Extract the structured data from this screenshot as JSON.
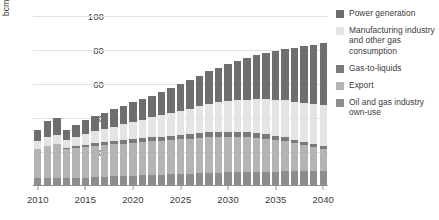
{
  "chart_data": {
    "type": "bar",
    "stacked": true,
    "title": "",
    "subtitle": "",
    "xlabel": "",
    "ylabel": "bcm",
    "ylim": [
      0,
      100
    ],
    "yticks": [
      20,
      40,
      60,
      80,
      100
    ],
    "xticks": [
      2010,
      2015,
      2020,
      2025,
      2030,
      2035,
      2040
    ],
    "grid": true,
    "legend_position": "right",
    "categories": [
      "2010",
      "2011",
      "2012",
      "2013",
      "2014",
      "2015",
      "2016",
      "2017",
      "2018",
      "2019",
      "2020",
      "2021",
      "2022",
      "2023",
      "2024",
      "2025",
      "2026",
      "2027",
      "2028",
      "2029",
      "2030",
      "2031",
      "2032",
      "2033",
      "2034",
      "2035",
      "2036",
      "2037",
      "2038",
      "2039",
      "2040"
    ],
    "series": [
      {
        "name": "Oil and gas industry own-use",
        "color": "#8d8d8d",
        "values": [
          4.5,
          4.8,
          5.0,
          4.6,
          4.8,
          5.0,
          5.2,
          5.4,
          5.6,
          5.8,
          6.0,
          6.2,
          6.4,
          6.6,
          6.8,
          7.0,
          7.2,
          7.4,
          7.6,
          7.8,
          8.0,
          8.1,
          8.2,
          8.3,
          8.4,
          8.5,
          8.6,
          8.7,
          8.8,
          8.9,
          9.0
        ]
      },
      {
        "name": "Export",
        "color": "#b4b4b4",
        "values": [
          17.5,
          19.0,
          19.5,
          17.0,
          17.5,
          18.0,
          18.5,
          18.8,
          19.0,
          19.2,
          19.4,
          19.6,
          19.8,
          20.0,
          20.2,
          20.4,
          20.6,
          20.8,
          21.0,
          21.0,
          21.0,
          20.8,
          20.5,
          20.0,
          19.4,
          18.6,
          17.6,
          16.4,
          15.2,
          14.0,
          12.8
        ]
      },
      {
        "name": "Gas-to-liquids",
        "color": "#7a7a7a",
        "values": [
          0.0,
          0.0,
          0.0,
          0.6,
          1.0,
          1.2,
          1.4,
          1.6,
          1.8,
          2.0,
          2.2,
          2.3,
          2.4,
          2.5,
          2.6,
          2.7,
          2.8,
          2.9,
          3.0,
          3.0,
          3.0,
          2.9,
          2.8,
          2.7,
          2.6,
          2.5,
          2.4,
          2.2,
          2.0,
          1.8,
          1.6
        ]
      },
      {
        "name": "Manufacturing industry and other gas consumption",
        "color": "#e4e4e4",
        "values": [
          4.5,
          5.0,
          5.5,
          5.0,
          5.6,
          6.2,
          7.0,
          7.8,
          8.6,
          9.4,
          10.2,
          11.0,
          11.8,
          12.6,
          13.4,
          14.2,
          15.0,
          15.8,
          16.6,
          17.4,
          18.2,
          18.8,
          19.4,
          20.0,
          20.6,
          21.2,
          21.8,
          22.4,
          23.0,
          23.6,
          24.2
        ]
      },
      {
        "name": "Power generation",
        "color": "#6e6e6e",
        "values": [
          6.5,
          9.2,
          10.0,
          5.8,
          7.1,
          8.6,
          9.0,
          9.6,
          10.2,
          10.8,
          11.4,
          12.0,
          12.8,
          13.6,
          14.6,
          15.6,
          16.8,
          18.0,
          19.2,
          20.4,
          21.6,
          23.0,
          24.4,
          25.8,
          27.2,
          28.6,
          30.0,
          31.6,
          33.2,
          34.8,
          36.4
        ]
      }
    ],
    "totals": [
      33.0,
      38.0,
      40.0,
      33.0,
      36.0,
      39.0,
      41.1,
      43.2,
      45.2,
      47.2,
      49.2,
      51.1,
      53.2,
      55.3,
      57.6,
      59.9,
      62.4,
      64.9,
      67.4,
      69.6,
      71.8,
      73.6,
      75.3,
      76.8,
      78.2,
      79.4,
      80.4,
      81.3,
      82.2,
      83.1,
      84.0
    ]
  },
  "legend": {
    "items": [
      {
        "label": "Power generation",
        "color": "#6e6e6e"
      },
      {
        "label": "Manufacturing industry and other gas consumption",
        "color": "#e4e4e4"
      },
      {
        "label": "Gas-to-liquids",
        "color": "#7a7a7a"
      },
      {
        "label": "Export",
        "color": "#b4b4b4"
      },
      {
        "label": "Oil and gas industry own-use",
        "color": "#8d8d8d"
      }
    ]
  }
}
